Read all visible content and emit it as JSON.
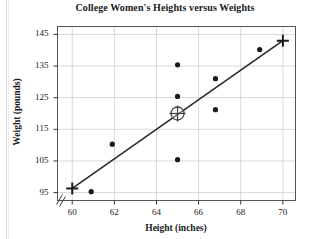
{
  "chart_data": {
    "type": "scatter",
    "title": "College Women's Heights versus Weights",
    "xlabel": "Height (inches)",
    "ylabel": "Weight (pounds)",
    "xlim": [
      59.3,
      70.6
    ],
    "ylim": [
      92.5,
      147.5
    ],
    "xticks": [
      60,
      62,
      64,
      66,
      68,
      70
    ],
    "yticks": [
      95,
      105,
      115,
      125,
      135,
      145
    ],
    "xtick_labels": [
      "60",
      "62",
      "64",
      "66",
      "68",
      "70"
    ],
    "ytick_labels": [
      "95",
      "105",
      "115",
      "125",
      "135",
      "145"
    ],
    "grid": true,
    "legend": "none",
    "axis_break": true,
    "axis_break_symbol": "zigzag",
    "points": [
      {
        "x": 60.9,
        "y": 95.3
      },
      {
        "x": 61.9,
        "y": 110.3
      },
      {
        "x": 65.0,
        "y": 105.4
      },
      {
        "x": 65.0,
        "y": 125.4
      },
      {
        "x": 65.0,
        "y": 135.4
      },
      {
        "x": 66.8,
        "y": 121.2
      },
      {
        "x": 66.8,
        "y": 131.0
      },
      {
        "x": 68.9,
        "y": 140.2
      }
    ],
    "highlighted_point": {
      "x": 65.0,
      "y": 120.0,
      "marker": "circled-crosshair"
    },
    "line": {
      "type": "regression-line",
      "x_start": 60.0,
      "y_start": 96.3,
      "x_end": 70.0,
      "y_end": 143.0,
      "endpoint_markers": "plus"
    },
    "endpoint_markers": [
      {
        "x": 60.0,
        "y": 96.3,
        "marker": "plus"
      },
      {
        "x": 70.0,
        "y": 143.0,
        "marker": "plus"
      }
    ]
  }
}
